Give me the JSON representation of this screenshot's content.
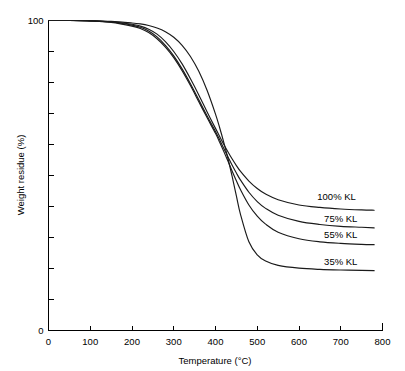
{
  "chart_data": {
    "type": "line",
    "title": "",
    "subtitle": "",
    "xlabel": "Temperature (°C)",
    "ylabel": "Weight residue (%)",
    "xlim": [
      0,
      800
    ],
    "ylim": [
      0,
      100
    ],
    "xticks": [
      0,
      100,
      200,
      300,
      400,
      500,
      600,
      700,
      800
    ],
    "xtick_labels": [
      "0",
      "100",
      "200",
      "300",
      "400",
      "500",
      "600",
      "700",
      "800"
    ],
    "yticks": [
      0,
      10,
      20,
      30,
      40,
      50,
      60,
      70,
      80,
      90,
      100
    ],
    "ytick_labels": [
      "0",
      "",
      "",
      "",
      "",
      "",
      "",
      "",
      "",
      "",
      "100"
    ],
    "grid": false,
    "legend_position": "inline-right",
    "annotations": [
      {
        "text": "100% KL",
        "x": 690,
        "y": 42
      },
      {
        "text": "75% KL",
        "x": 700,
        "y": 35
      },
      {
        "text": "55% KL",
        "x": 700,
        "y": 30
      },
      {
        "text": "35% KL",
        "x": 700,
        "y": 21
      }
    ],
    "x": [
      0,
      50,
      100,
      150,
      200,
      220,
      240,
      260,
      280,
      300,
      320,
      340,
      360,
      380,
      400,
      410,
      420,
      430,
      440,
      450,
      460,
      480,
      500,
      520,
      550,
      600,
      650,
      700,
      750,
      780
    ],
    "series": [
      {
        "name": "100% KL",
        "label": "100% KL",
        "color": "#1a1a1a",
        "values": [
          100,
          100,
          99.9,
          99.6,
          98.8,
          98.2,
          97.2,
          95.6,
          93.2,
          90.0,
          86.0,
          81.2,
          76.0,
          70.5,
          65.2,
          62.6,
          60.0,
          57.6,
          55.3,
          53.2,
          51.3,
          48.2,
          45.8,
          44.0,
          42.2,
          40.5,
          39.7,
          39.2,
          38.9,
          38.8
        ]
      },
      {
        "name": "75% KL",
        "label": "75% KL",
        "color": "#1a1a1a",
        "values": [
          100,
          100,
          99.9,
          99.5,
          98.5,
          97.8,
          96.6,
          94.7,
          92.0,
          88.6,
          84.4,
          79.6,
          74.4,
          69.2,
          64.2,
          61.5,
          58.7,
          56.0,
          53.3,
          50.8,
          48.5,
          44.6,
          41.6,
          39.4,
          37.2,
          35.2,
          34.2,
          33.6,
          33.3,
          33.1
        ]
      },
      {
        "name": "55% KL",
        "label": "55% KL",
        "color": "#1a1a1a",
        "values": [
          100,
          100,
          99.9,
          99.4,
          98.2,
          97.4,
          96.1,
          94.1,
          91.4,
          88.0,
          83.8,
          79.0,
          73.8,
          68.6,
          63.6,
          60.7,
          57.7,
          54.6,
          51.4,
          48.3,
          45.4,
          40.5,
          36.9,
          34.3,
          31.7,
          29.6,
          28.6,
          28.1,
          27.8,
          27.7
        ]
      },
      {
        "name": "35% KL",
        "label": "35% KL",
        "color": "#1a1a1a",
        "values": [
          100,
          100,
          99.9,
          99.7,
          99.2,
          98.9,
          98.4,
          97.6,
          96.4,
          94.6,
          92.0,
          88.4,
          83.6,
          77.4,
          69.8,
          65.4,
          60.6,
          55.4,
          49.6,
          43.4,
          37.4,
          28.6,
          24.4,
          22.4,
          21.0,
          20.1,
          19.7,
          19.5,
          19.4,
          19.3
        ]
      }
    ]
  },
  "axes": {
    "y_max_label": "100",
    "y_min_label": "0",
    "y_title": "Weight residue (%)",
    "x_title": "Temperature (°C)"
  }
}
